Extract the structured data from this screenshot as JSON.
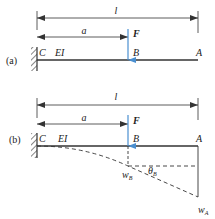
{
  "figure": {
    "colors": {
      "line": "#333333",
      "force": "#4a8fd0",
      "background": "#ffffff"
    },
    "panel_a": {
      "tag": "(a)",
      "length_label": "l",
      "distance_label": "a",
      "force_label": "F",
      "support_label": "C",
      "stiffness_label": "EI",
      "point_b_label": "B",
      "point_a_label": "A"
    },
    "panel_b": {
      "tag": "(b)",
      "length_label": "l",
      "distance_label": "a",
      "force_label": "F",
      "support_label": "C",
      "stiffness_label": "EI",
      "point_b_label": "B",
      "point_a_label": "A",
      "deflection_b_label": "w",
      "deflection_b_sub": "B",
      "rotation_b_label": "θ",
      "rotation_b_sub": "B",
      "deflection_a_label": "w",
      "deflection_a_sub": "A"
    }
  }
}
